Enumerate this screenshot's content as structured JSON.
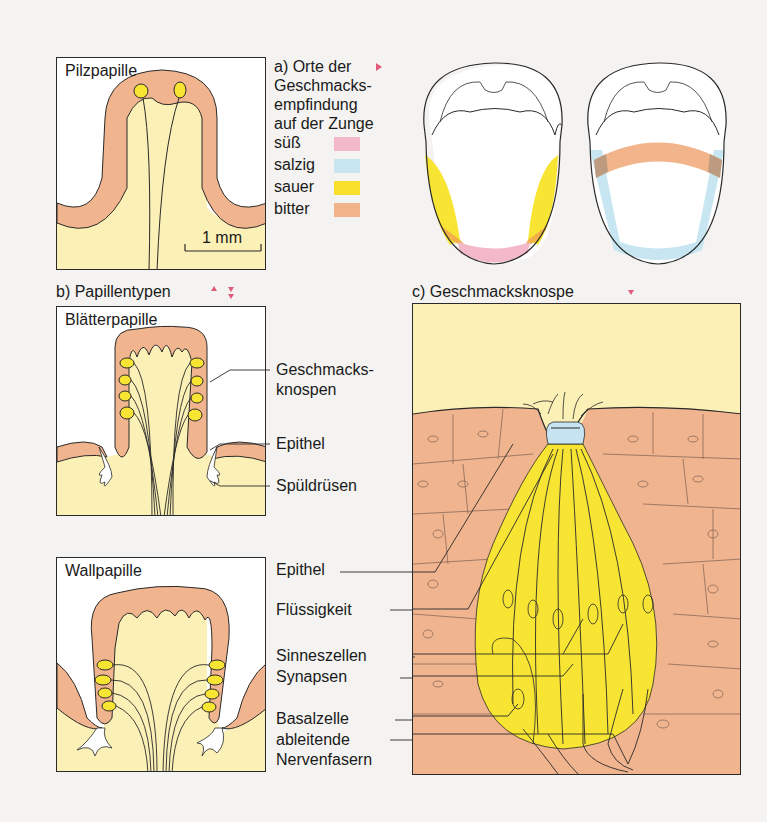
{
  "panels": {
    "pilzpapille": {
      "title": "Pilzpapille",
      "scale_label": "1 mm"
    },
    "blaetterpapille": {
      "title": "Blätterpapille"
    },
    "wallpapille": {
      "title": "Wallpapille"
    }
  },
  "section_a": {
    "heading_lines": [
      "a) Orte der",
      "Geschmacks-",
      "empfindung",
      "auf der Zunge"
    ],
    "legend": [
      {
        "label": "süß",
        "color": "#f4b9c8"
      },
      {
        "label": "salzig",
        "color": "#c8e6f2"
      },
      {
        "label": "sauer",
        "color": "#f7df2a"
      },
      {
        "label": "bitter",
        "color": "#f2b48a"
      }
    ]
  },
  "section_b": {
    "heading": "b) Papillentypen",
    "labels": [
      "Geschmacks-",
      "knospen",
      "Epithel",
      "Spüldrüsen"
    ]
  },
  "section_c": {
    "heading": "c) Geschmacksknospe",
    "labels": [
      "Epithel",
      "Flüssigkeit",
      "Sinneszellen",
      "Synapsen",
      "Basalzelle",
      "ableitende",
      "Nervenfasern"
    ]
  },
  "colors": {
    "tissue": "#f0b48e",
    "connective": "#fbf0b5",
    "bud": "#f7e433",
    "fluid": "#c6e3f1",
    "marker": "#e05a7a",
    "line": "#2a2a2a"
  }
}
